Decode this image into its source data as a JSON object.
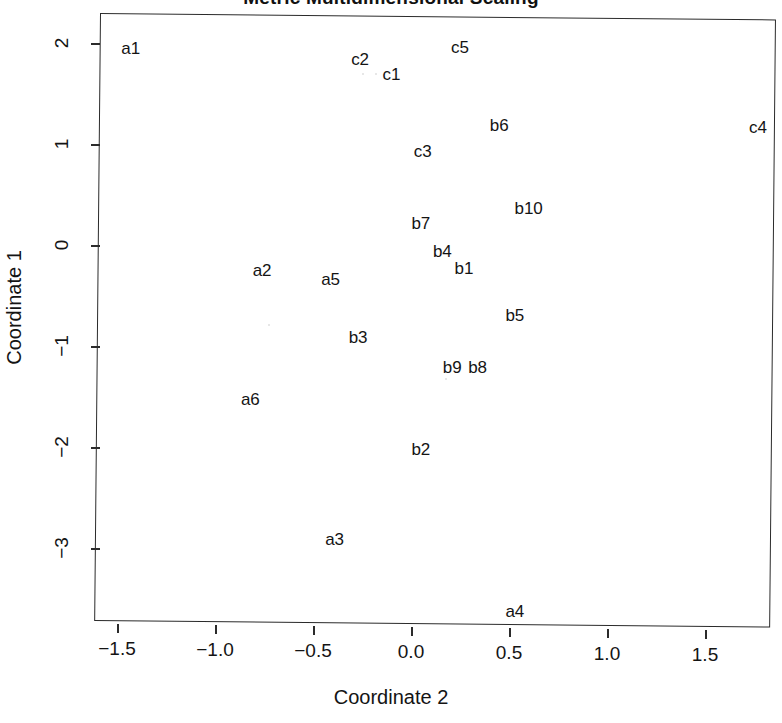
{
  "chart_data": {
    "type": "scatter",
    "title": "Metric Multidimensional Scaling",
    "xlabel": "Coordinate 2",
    "ylabel": "Coordinate 1",
    "xlim": [
      -1.59,
      1.86
    ],
    "ylim": [
      -3.43,
      2.3
    ],
    "grid": false,
    "legend": null,
    "marker": "text-labels-only",
    "xticks": [
      "-1.5",
      "-1.0",
      "-0.5",
      "0.0",
      "0.5",
      "1.0",
      "1.5"
    ],
    "xtick_values": [
      -1.5,
      -1.0,
      -0.5,
      0.0,
      0.5,
      1.0,
      1.5
    ],
    "yticks": [
      "2",
      "1",
      "0",
      "-1",
      "-2",
      "-3"
    ],
    "ytick_values": [
      2,
      1,
      0,
      -1,
      -2,
      -3
    ],
    "points": [
      {
        "label": "a1",
        "x": -1.43,
        "y": 1.95
      },
      {
        "label": "c2",
        "x": -0.26,
        "y": 1.87
      },
      {
        "label": "c1",
        "x": -0.1,
        "y": 1.72
      },
      {
        "label": "c5",
        "x": 0.25,
        "y": 1.99
      },
      {
        "label": "b6",
        "x": 0.45,
        "y": 1.23
      },
      {
        "label": "c4",
        "x": 1.77,
        "y": 1.23
      },
      {
        "label": "c3",
        "x": 0.06,
        "y": 0.96
      },
      {
        "label": "b10",
        "x": 0.6,
        "y": 0.41
      },
      {
        "label": "b7",
        "x": 0.05,
        "y": 0.25
      },
      {
        "label": "b4",
        "x": 0.16,
        "y": -0.03
      },
      {
        "label": "b1",
        "x": 0.27,
        "y": -0.19
      },
      {
        "label": "a2",
        "x": -0.76,
        "y": -0.23
      },
      {
        "label": "a5",
        "x": -0.41,
        "y": -0.31
      },
      {
        "label": "b5",
        "x": 0.53,
        "y": -0.65
      },
      {
        "label": "b3",
        "x": -0.27,
        "y": -0.89
      },
      {
        "label": "b9",
        "x": 0.21,
        "y": -1.17
      },
      {
        "label": "b8",
        "x": 0.34,
        "y": -1.17
      },
      {
        "label": "a6",
        "x": -0.82,
        "y": -1.51
      },
      {
        "label": "b2",
        "x": 0.05,
        "y": -1.99
      },
      {
        "label": "a3",
        "x": -0.39,
        "y": -2.89
      },
      {
        "label": "a4",
        "x": 0.53,
        "y": -3.58
      }
    ]
  }
}
